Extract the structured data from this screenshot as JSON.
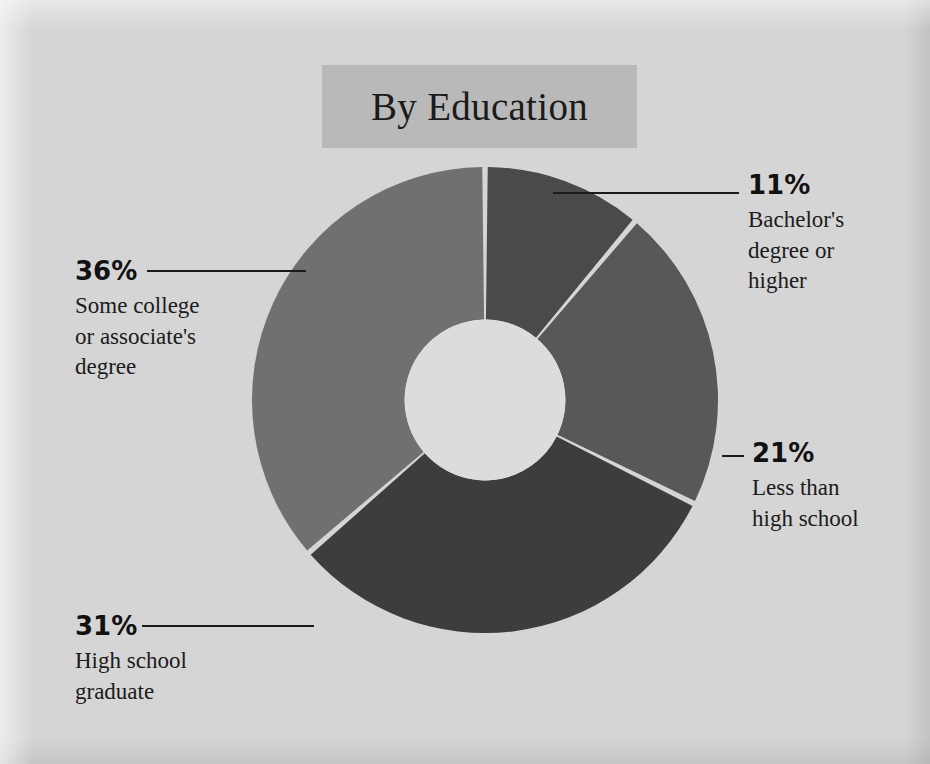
{
  "figure": {
    "background_color": "#d5d5d5",
    "banner_color": "#b9b9b9",
    "text_color": "#1b1b1b"
  },
  "title": {
    "text": "By Education"
  },
  "chart_data": {
    "type": "pie",
    "variant": "donut",
    "title": "By Education",
    "xlabel": "",
    "ylabel": "",
    "units": "percent",
    "start_angle_deg": 0,
    "direction": "clockwise",
    "inner_radius_ratio": 0.345,
    "gap_color": "#e9e9e9",
    "legend_position": "callouts",
    "grid": false,
    "categories": [
      "Bachelor's degree or higher",
      "Less than high school",
      "High school graduate",
      "Some college or associate's degree"
    ],
    "values": [
      11,
      21,
      31,
      36
    ],
    "colors": [
      "#4a4a4a",
      "#585858",
      "#3d3d3d",
      "#707070"
    ],
    "slices": [
      {
        "label": "Bachelor's degree or higher",
        "value": 11,
        "display_value": "11%",
        "color": "#4a4a4a",
        "start_deg": 0,
        "end_deg": 39.6,
        "label_lines": [
          "Bachelor's",
          "degree or",
          "higher"
        ]
      },
      {
        "label": "Less than high school",
        "value": 21,
        "display_value": "21%",
        "color": "#585858",
        "start_deg": 39.6,
        "end_deg": 115.2,
        "label_lines": [
          "Less than",
          "high school"
        ]
      },
      {
        "label": "High school graduate",
        "value": 31,
        "display_value": "31%",
        "color": "#3d3d3d",
        "start_deg": 115.2,
        "end_deg": 226.8,
        "label_lines": [
          "High school",
          "graduate"
        ]
      },
      {
        "label": "Some college or associate's degree",
        "value": 36,
        "display_value": "36%",
        "color": "#707070",
        "start_deg": 226.8,
        "end_deg": 360,
        "label_lines": [
          "Some college",
          "or associate's",
          "degree"
        ]
      }
    ]
  },
  "callouts": {
    "bachelors": {
      "pct": "11%",
      "line1": "Bachelor's",
      "line2": "degree or",
      "line3": "higher"
    },
    "less_than_high_school": {
      "pct": "21%",
      "line1": "Less than",
      "line2": "high school"
    },
    "some_college": {
      "pct": "36%",
      "line1": "Some college",
      "line2": "or associate's",
      "line3": "degree"
    },
    "high_school_graduate": {
      "pct": "31%",
      "line1": "High school",
      "line2": "graduate"
    }
  }
}
